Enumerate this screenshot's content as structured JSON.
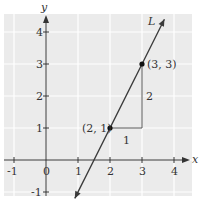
{
  "chart_data": {
    "type": "line",
    "title": "",
    "xlabel": "x",
    "ylabel": "y",
    "xlim": [
      -1.3,
      4.4
    ],
    "ylim": [
      -1.3,
      4.4
    ],
    "grid": true,
    "x_ticks": [
      "-1",
      "0",
      "1",
      "2",
      "3",
      "4"
    ],
    "y_ticks": [
      "-1",
      "1",
      "2",
      "3",
      "4"
    ],
    "series": [
      {
        "name": "L",
        "equation": "y = 2x - 3",
        "x": [
          0.9,
          3.7
        ],
        "y": [
          -1.2,
          4.4
        ]
      }
    ],
    "points": [
      {
        "label": "(2, 1)",
        "x": 2,
        "y": 1
      },
      {
        "label": "(3, 3)",
        "x": 3,
        "y": 3
      }
    ],
    "annotations": [
      {
        "text": "1",
        "meaning": "run",
        "x": 2.5,
        "y": 0.75
      },
      {
        "text": "2",
        "meaning": "rise",
        "x": 3.2,
        "y": 2
      },
      {
        "text": "L",
        "meaning": "line label",
        "x": 3.3,
        "y": 4.15
      }
    ],
    "colors": {
      "grid_bg": "#ebebeb",
      "grid_line": "#ffffff",
      "line": "#3a3a3a",
      "axis": "#333333"
    }
  }
}
